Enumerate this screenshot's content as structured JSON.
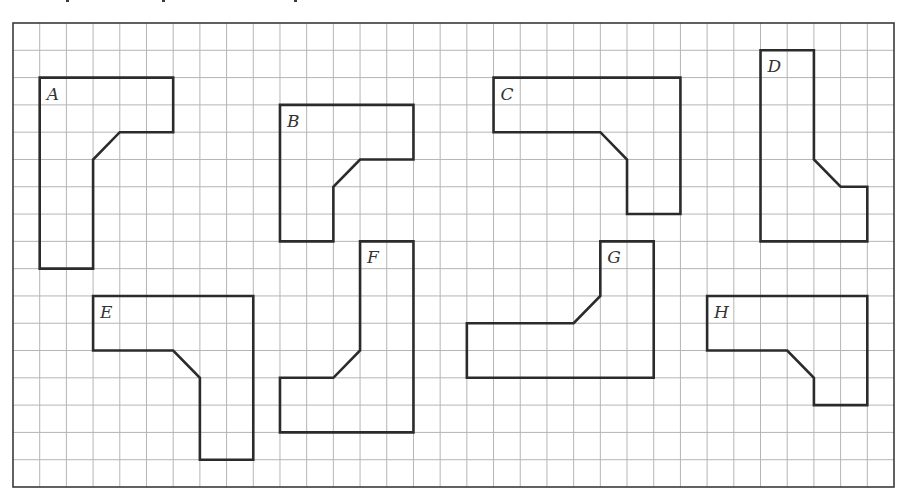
{
  "figure": {
    "grid": {
      "columns": 33,
      "rows": 17
    },
    "colors": {
      "grid": "#b5b5b5",
      "outline": "#2b2b2b",
      "label": "#333333"
    },
    "shapes": [
      {
        "label": "A",
        "points": [
          [
            1,
            2
          ],
          [
            6,
            2
          ],
          [
            6,
            4
          ],
          [
            4,
            4
          ],
          [
            3,
            5
          ],
          [
            3,
            9
          ],
          [
            1,
            9
          ]
        ]
      },
      {
        "label": "B",
        "points": [
          [
            10,
            3
          ],
          [
            15,
            3
          ],
          [
            15,
            5
          ],
          [
            13,
            5
          ],
          [
            12,
            6
          ],
          [
            12,
            8
          ],
          [
            10,
            8
          ]
        ]
      },
      {
        "label": "C",
        "points": [
          [
            18,
            2
          ],
          [
            25,
            2
          ],
          [
            25,
            7
          ],
          [
            23,
            7
          ],
          [
            23,
            5
          ],
          [
            22,
            4
          ],
          [
            18,
            4
          ]
        ]
      },
      {
        "label": "D",
        "points": [
          [
            28,
            1
          ],
          [
            30,
            1
          ],
          [
            30,
            5
          ],
          [
            31,
            6
          ],
          [
            32,
            6
          ],
          [
            32,
            8
          ],
          [
            28,
            8
          ]
        ]
      },
      {
        "label": "E",
        "points": [
          [
            3,
            10
          ],
          [
            9,
            10
          ],
          [
            9,
            16
          ],
          [
            7,
            16
          ],
          [
            7,
            13
          ],
          [
            6,
            12
          ],
          [
            3,
            12
          ]
        ]
      },
      {
        "label": "F",
        "points": [
          [
            13,
            8
          ],
          [
            15,
            8
          ],
          [
            15,
            15
          ],
          [
            10,
            15
          ],
          [
            10,
            13
          ],
          [
            12,
            13
          ],
          [
            13,
            12
          ]
        ]
      },
      {
        "label": "G",
        "points": [
          [
            22,
            8
          ],
          [
            24,
            8
          ],
          [
            24,
            13
          ],
          [
            17,
            13
          ],
          [
            17,
            11
          ],
          [
            21,
            11
          ],
          [
            22,
            10
          ]
        ]
      },
      {
        "label": "H",
        "points": [
          [
            26,
            10
          ],
          [
            32,
            10
          ],
          [
            32,
            14
          ],
          [
            30,
            14
          ],
          [
            30,
            13
          ],
          [
            29,
            12
          ],
          [
            26,
            12
          ]
        ]
      }
    ]
  }
}
